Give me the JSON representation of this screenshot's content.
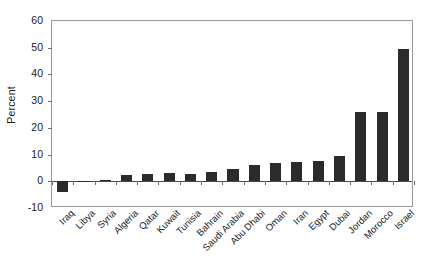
{
  "chart_data": {
    "type": "bar",
    "title": "",
    "subtitle": "",
    "xlabel": "",
    "ylabel": "Percent",
    "ylim": [
      -10,
      60
    ],
    "yticks": [
      -10,
      0,
      10,
      20,
      30,
      40,
      50,
      60
    ],
    "ytick_labels": [
      "-10",
      "0",
      "10",
      "20",
      "30",
      "40",
      "50",
      "60"
    ],
    "grid": false,
    "legend": null,
    "bar_color": "#2b2b2b",
    "categories": [
      "Iraq",
      "Libya",
      "Syria",
      "Algeria",
      "Qatar",
      "Kuwait",
      "Tunisia",
      "Bahrain",
      "Saudi Arabia",
      "Abu Dhabi",
      "Oman",
      "Iran",
      "Egypt",
      "Dubai",
      "Jordan",
      "Morocco",
      "Israel"
    ],
    "values": [
      -4,
      0,
      0.5,
      2.5,
      2.8,
      3,
      2.8,
      3.5,
      4.5,
      6,
      7,
      7.3,
      7.5,
      9.5,
      26,
      26,
      49.5
    ]
  }
}
